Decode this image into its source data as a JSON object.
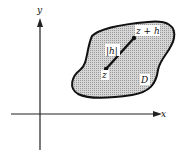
{
  "diagram": {
    "axes": {
      "x_label": "x",
      "y_label": "y"
    },
    "region": {
      "label": "D",
      "fill": "#c8c8c8",
      "stroke": "#111111"
    },
    "points": {
      "start_label": "z",
      "end_label": "z + h"
    },
    "segment": {
      "label": "|h|"
    }
  }
}
